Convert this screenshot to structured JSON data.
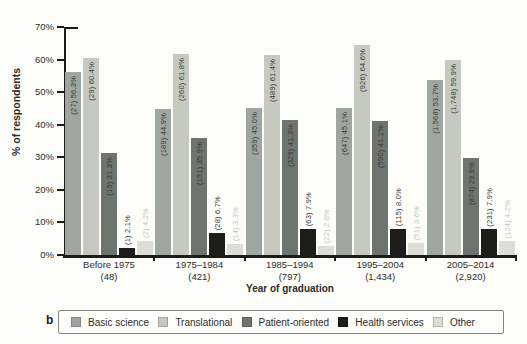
{
  "figure": {
    "panel_label": "b"
  },
  "chart_data": {
    "type": "bar",
    "title": "",
    "ylabel": "% of respondents",
    "xlabel": "Year of graduation",
    "ylim": [
      0,
      70
    ],
    "ytick_step": 10,
    "ytick_labels": [
      "0%",
      "10%",
      "20%",
      "30%",
      "40%",
      "50%",
      "60%",
      "70%"
    ],
    "grid": false,
    "legend_position": "bottom",
    "categories": [
      {
        "label": "Before 1975",
        "n_label": "(48)"
      },
      {
        "label": "1975–1984",
        "n_label": "(421)"
      },
      {
        "label": "1985–1994",
        "n_label": "(797)"
      },
      {
        "label": "1995–2004",
        "n_label": "(1,434)"
      },
      {
        "label": "2005–2014",
        "n_label": "(2,920)"
      }
    ],
    "series": [
      {
        "name": "Basic science",
        "color": "#9fa69f",
        "label_color": "#3a3a36",
        "label_placement": "inside",
        "values": [
          56.3,
          44.9,
          45.0,
          45.1,
          53.7
        ],
        "bar_labels": [
          "(27) 56.3%",
          "(189) 44.9%",
          "(359) 45.0%",
          "(647) 45.1%",
          "(1,568) 53.7%"
        ]
      },
      {
        "name": "Translational",
        "color": "#c5c9c0",
        "label_color": "#3a3a36",
        "label_placement": "inside",
        "values": [
          60.4,
          61.8,
          61.4,
          64.6,
          59.9
        ],
        "bar_labels": [
          "(29) 60.4%",
          "(260) 61.8%",
          "(489) 61.4%",
          "(926) 64.6%",
          "(1,748) 59.9%"
        ]
      },
      {
        "name": "Patient-oriented",
        "color": "#6e746e",
        "label_color": "#3a3a36",
        "label_placement": "inside",
        "values": [
          31.3,
          35.9,
          41.3,
          41.1,
          29.9
        ],
        "bar_labels": [
          "(15) 31.3%",
          "(151) 35.9%",
          "(329) 41.3%",
          "(590) 41.1%",
          "(874) 29.9%"
        ]
      },
      {
        "name": "Health services",
        "color": "#1d1d1b",
        "label_color": "#3a3a36",
        "label_placement": "above",
        "values": [
          2.1,
          6.7,
          7.9,
          8.0,
          7.9
        ],
        "bar_labels": [
          "(1) 2.1%",
          "(28) 6.7%",
          "(63) 7.9%",
          "(115) 8.0%",
          "(231) 7.9%"
        ]
      },
      {
        "name": "Other",
        "color": "#dcded5",
        "label_color": "#c6cabf",
        "label_placement": "above",
        "values": [
          4.2,
          3.3,
          2.8,
          3.6,
          4.2
        ],
        "bar_labels": [
          "(2) 4.2%",
          "(14) 3.3%",
          "(22) 2.8%",
          "(51) 3.6%",
          "(124) 4.2%"
        ]
      }
    ]
  }
}
